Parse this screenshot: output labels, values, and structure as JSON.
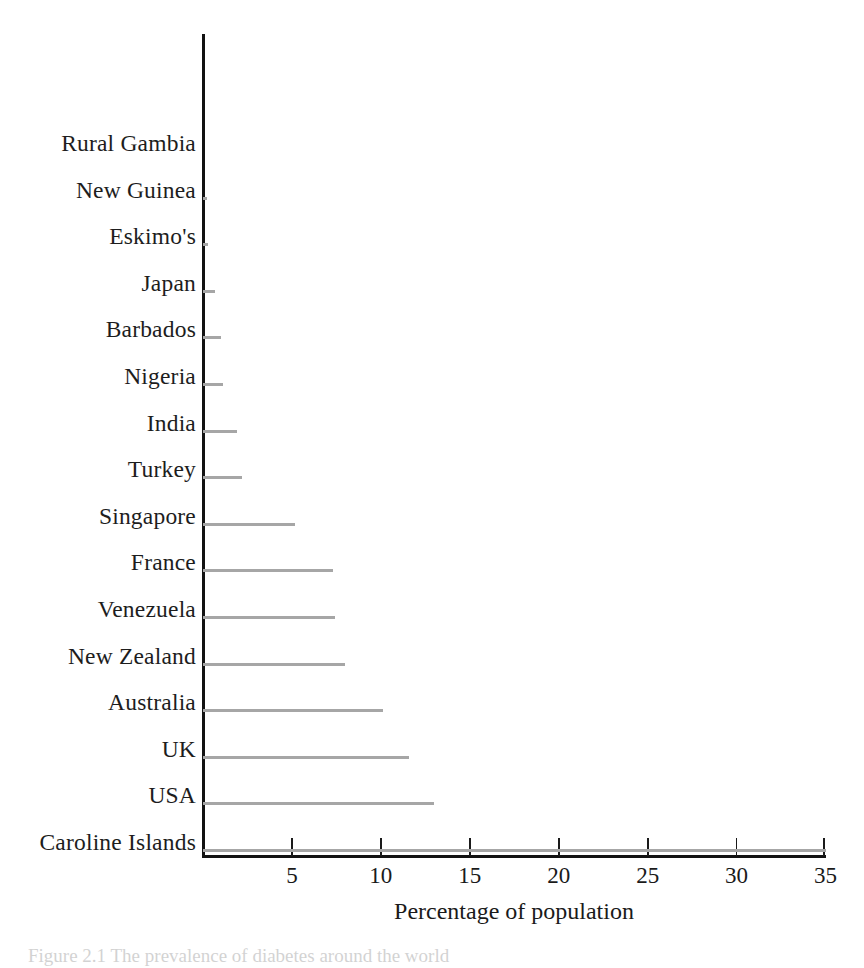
{
  "chart_data": {
    "type": "bar",
    "orientation": "horizontal",
    "title": "",
    "xlabel": "Percentage of population",
    "ylabel": "",
    "xlim": [
      0,
      35
    ],
    "xticks": [
      5,
      10,
      15,
      20,
      25,
      30,
      35
    ],
    "xtick_labels": [
      "5",
      "10",
      "15",
      "20",
      "25",
      "30",
      "35"
    ],
    "grid": false,
    "legend": null,
    "bar_color": "#a6a6a6",
    "axis_color": "#121212",
    "categories": [
      "Rural Gambia",
      "New Guinea",
      "Eskimo's",
      "Japan",
      "Barbados",
      "Nigeria",
      "India",
      "Turkey",
      "Singapore",
      "France",
      "Venezuela",
      "New Zealand",
      "Australia",
      "UK",
      "USA",
      "Caroline Islands"
    ],
    "values": [
      0,
      0.2,
      0.3,
      0.7,
      1.0,
      1.1,
      1.9,
      2.2,
      5.2,
      7.3,
      7.4,
      8.0,
      10.1,
      11.6,
      13.0,
      35.0
    ]
  },
  "caption": {
    "text": "Figure 2.1 The prevalence of diabetes around the world"
  }
}
